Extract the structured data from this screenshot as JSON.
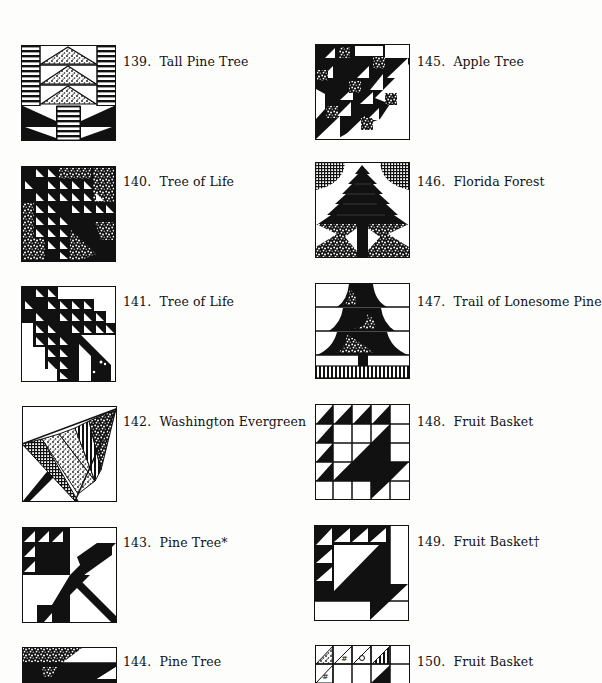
{
  "page": {
    "background": "#fdfdfc",
    "ink": "#111111"
  },
  "entries": [
    {
      "num": "139.",
      "name": "Tall Pine Tree"
    },
    {
      "num": "140.",
      "name": "Tree of Life"
    },
    {
      "num": "141.",
      "name": "Tree of Life"
    },
    {
      "num": "142.",
      "name": "Washington Evergreen"
    },
    {
      "num": "143.",
      "name": "Pine Tree*"
    },
    {
      "num": "144.",
      "name": "Pine Tree"
    },
    {
      "num": "145.",
      "name": "Apple Tree"
    },
    {
      "num": "146.",
      "name": "Florida Forest"
    },
    {
      "num": "147.",
      "name": "Trail of Lonesome Pine"
    },
    {
      "num": "148.",
      "name": "Fruit Basket"
    },
    {
      "num": "149.",
      "name": "Fruit Basket†"
    },
    {
      "num": "150.",
      "name": "Fruit Basket"
    }
  ]
}
